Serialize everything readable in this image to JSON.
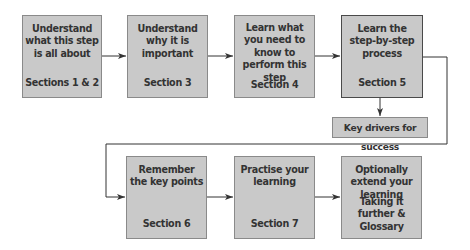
{
  "diagram": {
    "steps": [
      {
        "title": "Understand\nwhat this step\nis all about",
        "section": "Sections 1 & 2"
      },
      {
        "title": "Understand\nwhy it is\nimportant",
        "section": "Section 3"
      },
      {
        "title": "Learn what\nyou need to\nknow to\nperform this\nstep",
        "section": "Section 4"
      },
      {
        "title": "Learn the\nstep-by-step\nprocess",
        "section": "Section 5"
      },
      {
        "title": "Remember\nthe key points",
        "section": "Section 6"
      },
      {
        "title": "Practise your\nlearning",
        "section": "Section 7"
      },
      {
        "title": "Optionally\nextend your\nlearning",
        "section": "Taking it\nfurther & Glossary"
      }
    ],
    "key_drivers": "Key drivers for success",
    "colors": {
      "box_fill": "#c9c9c9",
      "box_border": "#8a8a8a",
      "line": "#333333"
    }
  }
}
